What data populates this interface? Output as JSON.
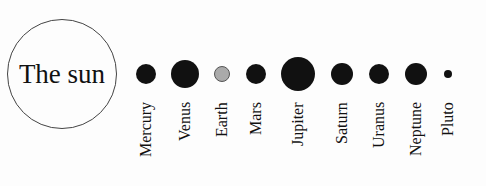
{
  "sun": {
    "label": "The sun"
  },
  "planets": [
    {
      "name": "Mercury",
      "cx": 146,
      "cy": 74,
      "r": 10,
      "color": "#111111"
    },
    {
      "name": "Venus",
      "cx": 185,
      "cy": 74,
      "r": 14,
      "color": "#111111"
    },
    {
      "name": "Earth",
      "cx": 222,
      "cy": 74,
      "r": 8,
      "color": "#aaaaaa"
    },
    {
      "name": "Mars",
      "cx": 256,
      "cy": 74,
      "r": 10,
      "color": "#111111"
    },
    {
      "name": "Jupiter",
      "cx": 298,
      "cy": 74,
      "r": 17,
      "color": "#111111"
    },
    {
      "name": "Saturn",
      "cx": 342,
      "cy": 74,
      "r": 11,
      "color": "#111111"
    },
    {
      "name": "Uranus",
      "cx": 379,
      "cy": 74,
      "r": 10,
      "color": "#111111"
    },
    {
      "name": "Neptune",
      "cx": 416,
      "cy": 74,
      "r": 11,
      "color": "#111111"
    },
    {
      "name": "Pluto",
      "cx": 448,
      "cy": 74,
      "r": 4,
      "color": "#111111"
    }
  ]
}
